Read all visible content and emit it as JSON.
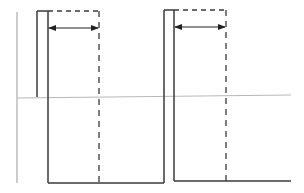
{
  "diagram": {
    "type": "pulse-timing-waveform",
    "colors": {
      "waveform": "#3a3a3a",
      "dashed": "#3a3a3a",
      "baseline": "#b8b8b8",
      "axis": "#9a9a9a",
      "arrow": "#222222"
    },
    "axis": {
      "x": 17,
      "y_top": 12,
      "y_bottom": 183
    },
    "baseline": {
      "x1": 17,
      "y1": 98,
      "x2": 291,
      "y2": 95
    },
    "pulses": [
      {
        "outer_x": 37,
        "inner_x": 48,
        "top_y": 11,
        "outer_bottom_y": 97,
        "inner_bottom_y": 183,
        "dashed_end_x": 99,
        "dashed_bottom_y": 183,
        "arrow": {
          "x1": 49,
          "x2": 98,
          "y": 28,
          "style": "double-headed"
        }
      },
      {
        "outer_x": 164,
        "inner_x": 174,
        "top_y": 10,
        "outer_bottom_y": 183,
        "inner_bottom_y": 181,
        "dashed_end_x": 226,
        "dashed_bottom_y": 181,
        "arrow": {
          "x1": 175,
          "x2": 225,
          "y": 27,
          "style": "double-headed"
        }
      }
    ],
    "bottom_segments": [
      {
        "x1": 48,
        "x2": 164,
        "y": 183
      },
      {
        "x1": 174,
        "x2": 291,
        "y": 181
      }
    ]
  }
}
